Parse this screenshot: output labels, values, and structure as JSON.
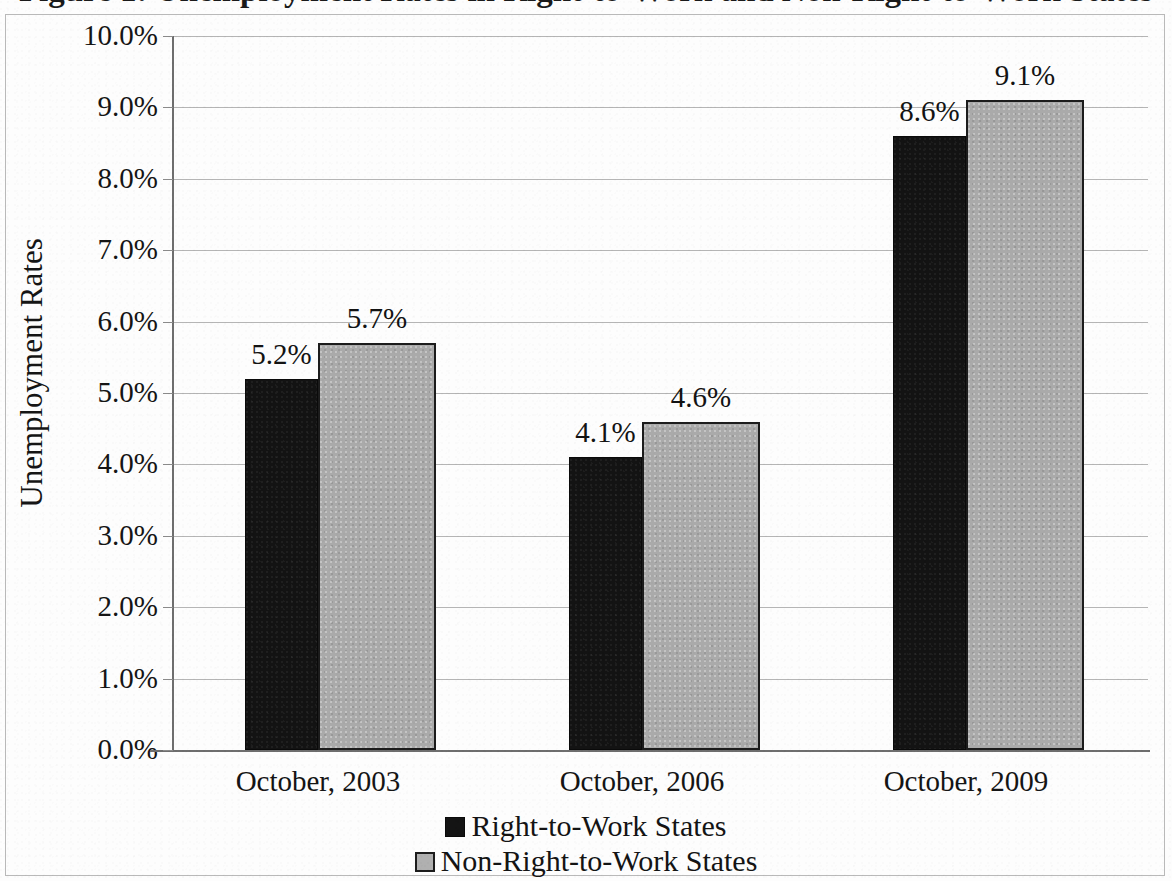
{
  "chart_data": {
    "type": "bar",
    "title": "Figure 1: Unemployment Rates in Right-to-Work and Non-Right-to-Work States",
    "xlabel": "",
    "ylabel": "Unemployment Rates",
    "categories": [
      "October, 2003",
      "October, 2006",
      "October, 2009"
    ],
    "series": [
      {
        "name": "Right-to-Work States",
        "color": "#131313",
        "values": [
          5.2,
          4.1,
          8.6
        ],
        "labels": [
          "5.2%",
          "4.1%",
          "8.6%"
        ]
      },
      {
        "name": "Non-Right-to-Work States",
        "color": "#aaaaaa",
        "values": [
          5.7,
          4.6,
          9.1
        ],
        "labels": [
          "5.7%",
          "4.6%",
          "9.1%"
        ]
      }
    ],
    "ylim": [
      0,
      10
    ],
    "ytick_values": [
      10.0,
      9.0,
      8.0,
      7.0,
      6.0,
      5.0,
      4.0,
      3.0,
      2.0,
      1.0,
      0.0
    ],
    "ytick_labels": [
      "10.0%",
      "9.0%",
      "8.0%",
      "7.0%",
      "6.0%",
      "5.0%",
      "4.0%",
      "3.0%",
      "2.0%",
      "1.0%",
      "0.0%"
    ],
    "grid": true,
    "grid_axis": "y",
    "legend_position": "bottom",
    "units": "percent"
  },
  "axis": {
    "y_title": "Unemployment Rates"
  },
  "legend": {
    "items": [
      {
        "label": "Right-to-Work States",
        "swatch": "black-square"
      },
      {
        "label": "Non-Right-to-Work States",
        "swatch": "gray-square"
      }
    ]
  },
  "colors": {
    "right_to_work": "#131313",
    "non_right_to_work": "#aaaaaa",
    "gridline": "#b5b5b5",
    "axis": "#6e6e6e",
    "text": "#151515",
    "background": "#fdfdfd"
  }
}
